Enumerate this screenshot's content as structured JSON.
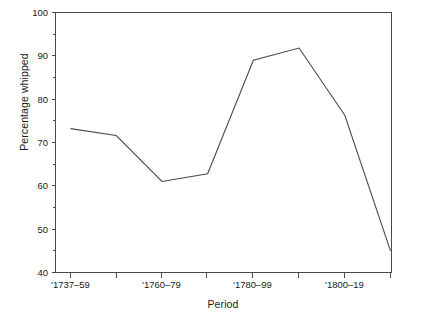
{
  "chart_data": {
    "type": "line",
    "title": "",
    "xlabel": "Period",
    "ylabel": "Percentage whipped",
    "categories": [
      "'1737–59",
      "",
      "'1760–79",
      "",
      "'1780–99",
      "",
      "'1800–19",
      ""
    ],
    "x_tick_labels": [
      "'1737–59",
      "'1760–79",
      "'1780–99",
      "'1800–19"
    ],
    "x_tick_label_indices": [
      0,
      2,
      4,
      6
    ],
    "y_tick_labels": [
      "40",
      "50",
      "60",
      "70",
      "80",
      "90",
      "100"
    ],
    "y_major_ticks": [
      40,
      50,
      60,
      70,
      80,
      90,
      100
    ],
    "y_minor_ticks": [
      45,
      55,
      65,
      75,
      85,
      95
    ],
    "values": [
      73.2,
      71.6,
      61.0,
      62.8,
      89.0,
      91.8,
      76.3,
      45.0
    ],
    "ylim": [
      40,
      100
    ],
    "grid": false,
    "legend": false,
    "line_color": "#4a4a4a",
    "axis_color": "#4a4a4a",
    "background_color": "#ffffff"
  },
  "axes": {
    "y_axis_title": "Percentage whipped",
    "x_axis_title": "Period"
  },
  "caption": {
    "text": ""
  }
}
